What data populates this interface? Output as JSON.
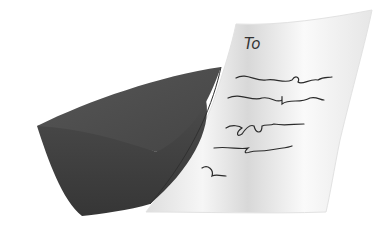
{
  "illustration": {
    "subject": "envelope-and-letter",
    "letter": {
      "salutation": "To",
      "scribble_lines": 5
    },
    "colors": {
      "background": "#ffffff",
      "envelope_front": "#3d3d3d",
      "envelope_flap": "#4a4a4a",
      "letter_paper": "#f4f4f4",
      "letter_shadow": "#dcdcdc",
      "ink": "#2b2b2b"
    }
  }
}
